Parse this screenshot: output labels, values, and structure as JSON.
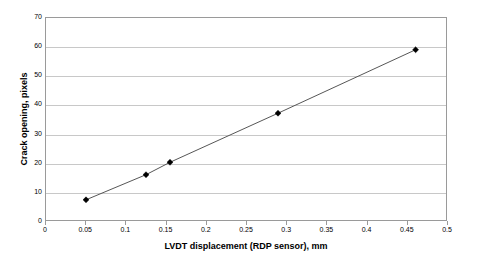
{
  "chart_data": {
    "type": "line",
    "title": "",
    "xlabel": "LVDT displacement (RDP sensor), mm",
    "ylabel": "Crack opening, pixels",
    "xlim": [
      0,
      0.5
    ],
    "ylim": [
      0,
      70
    ],
    "grid": "horizontal",
    "legend": "none",
    "marker": "filled-diamond",
    "x_ticks": [
      "0",
      "0.05",
      "0.1",
      "0.15",
      "0.2",
      "0.25",
      "0.3",
      "0.35",
      "0.4",
      "0.45",
      "0.5"
    ],
    "x_tick_values": [
      0,
      0.05,
      0.1,
      0.15,
      0.2,
      0.25,
      0.3,
      0.35,
      0.4,
      0.45,
      0.5
    ],
    "y_ticks": [
      "0",
      "10",
      "20",
      "30",
      "40",
      "50",
      "60",
      "70"
    ],
    "y_tick_values": [
      0,
      10,
      20,
      30,
      40,
      50,
      60,
      70
    ],
    "series": [
      {
        "name": "Crack opening vs LVDT displacement",
        "x": [
          0.05,
          0.125,
          0.155,
          0.29,
          0.462
        ],
        "values": [
          7,
          15.7,
          20,
          37,
          59
        ],
        "line_color": "#555555",
        "marker_color": "#000000"
      }
    ]
  },
  "colors": {
    "background": "#ffffff",
    "plot_border": "#9a9a9a",
    "gridline": "#c8c8c8",
    "text": "#000000"
  }
}
